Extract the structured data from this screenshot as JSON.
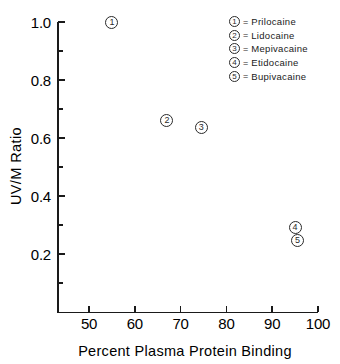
{
  "chart_data": {
    "type": "scatter",
    "title": "",
    "xlabel": "Percent Plasma Protein Binding",
    "ylabel": "UV/M Ratio",
    "xlim": [
      43,
      100
    ],
    "ylim": [
      0.1,
      1.0
    ],
    "grid": false,
    "legend_position": "top-right",
    "x_ticks": [
      {
        "value": 50,
        "label": "50"
      },
      {
        "value": 60,
        "label": "60"
      },
      {
        "value": 70,
        "label": "70"
      },
      {
        "value": 80,
        "label": "80"
      },
      {
        "value": 90,
        "label": "90"
      },
      {
        "value": 100,
        "label": "100"
      }
    ],
    "y_ticks_major": [
      {
        "value": 1.0,
        "label": "1.0"
      },
      {
        "value": 0.8,
        "label": "0.8"
      },
      {
        "value": 0.6,
        "label": "0.6"
      },
      {
        "value": 0.4,
        "label": "0.4"
      },
      {
        "value": 0.2,
        "label": "0.2"
      }
    ],
    "y_ticks_minor": [
      0.9,
      0.7,
      0.5,
      0.3,
      0.1
    ],
    "points": [
      {
        "id": "1",
        "name": "Prilocaine",
        "x": 55.0,
        "y": 1.0
      },
      {
        "id": "2",
        "name": "Lidocaine",
        "x": 67.0,
        "y": 0.66
      },
      {
        "id": "3",
        "name": "Mepivacaine",
        "x": 74.5,
        "y": 0.635
      },
      {
        "id": "4",
        "name": "Etidocaine",
        "x": 95.0,
        "y": 0.29
      },
      {
        "id": "5",
        "name": "Bupivacaine",
        "x": 95.5,
        "y": 0.245
      }
    ],
    "legend": [
      {
        "id": "1",
        "separator": "=",
        "label": "Prilocaine"
      },
      {
        "id": "2",
        "separator": "=",
        "label": "Lidocaine"
      },
      {
        "id": "3",
        "separator": "=",
        "label": "Mepivacaine"
      },
      {
        "id": "4",
        "separator": "=",
        "label": "Etidocaine"
      },
      {
        "id": "5",
        "separator": "=",
        "label": "Bupivacaine"
      }
    ],
    "colors": {
      "axis": "#1a1a1a",
      "marker": "#2a2a2a",
      "text": "#000000",
      "background": "#ffffff"
    }
  }
}
